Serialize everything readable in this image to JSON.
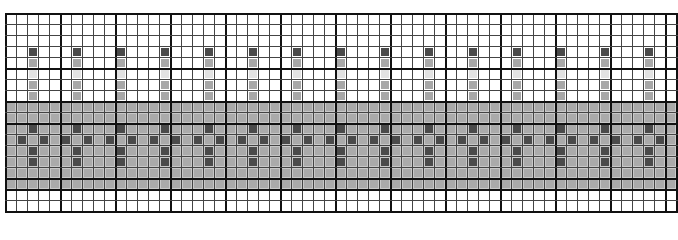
{
  "pattern": {
    "cols": 61,
    "rows": 18,
    "cell_size": 11,
    "major_every": 5,
    "origin": [
      5,
      13
    ],
    "repeat_period": 4,
    "motif_column_offset": 2,
    "colors": {
      "background": "#ffffff",
      "grid_line": "#444444",
      "major_line": "#111111",
      "band": "#c8c8c8",
      "band_cell": "#aaaaaa",
      "dark": "#4a4a4a",
      "mid": "#a8a8a8",
      "light": "#e2e2e2"
    },
    "band_rows": [
      8,
      15
    ],
    "stem": [
      {
        "row": 3,
        "tone": "dark"
      },
      {
        "row": 4,
        "tone": "mid"
      },
      {
        "row": 5,
        "tone": "light"
      },
      {
        "row": 6,
        "tone": "mid"
      },
      {
        "row": 7,
        "tone": "mid"
      }
    ],
    "motif": [
      {
        "row": 10,
        "offsets": [
          0
        ]
      },
      {
        "row": 11,
        "offsets": [
          -1,
          1
        ]
      },
      {
        "row": 12,
        "offsets": [
          0
        ]
      },
      {
        "row": 13,
        "offsets": [
          0
        ]
      }
    ]
  }
}
